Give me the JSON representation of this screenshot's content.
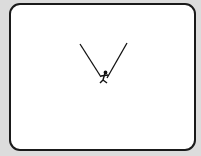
{
  "screen": {
    "background": "#ffffff",
    "border_color": "#1a1a1a"
  },
  "scene": {
    "rope_left": {
      "x1": 80,
      "y1": 44,
      "x2": 101,
      "y2": 77
    },
    "rope_right": {
      "x1": 127,
      "y1": 43,
      "x2": 107,
      "y2": 78
    },
    "figure": {
      "x": 104,
      "y": 78
    },
    "stroke_color": "#111111"
  }
}
